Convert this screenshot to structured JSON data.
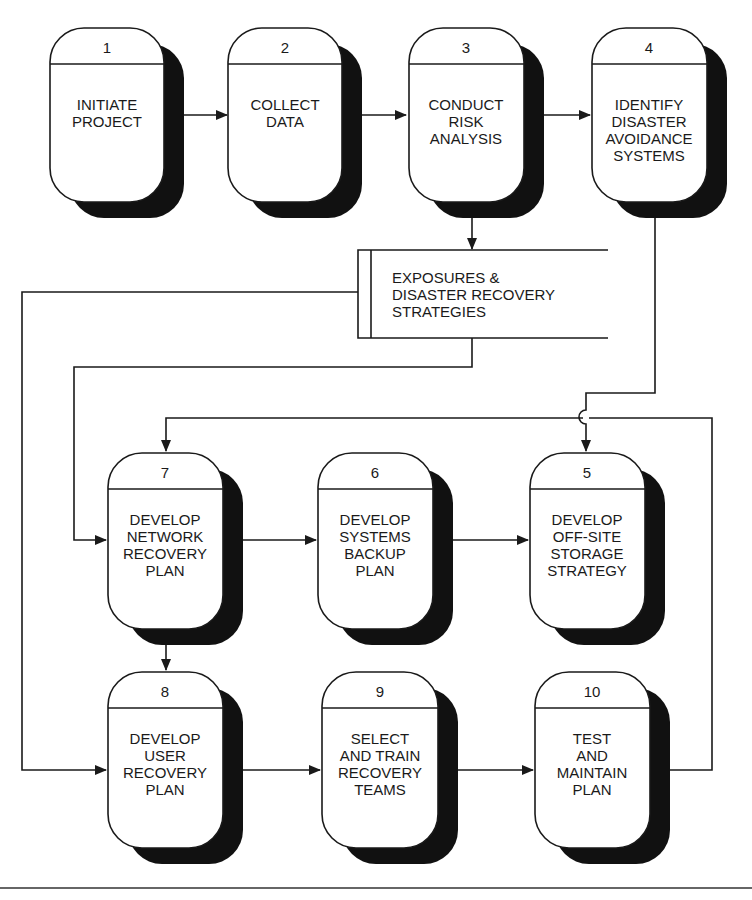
{
  "diagram": {
    "type": "process flowchart",
    "nodes": [
      {
        "id": "1",
        "number": "1",
        "lines": [
          "INITIATE",
          "PROJECT"
        ]
      },
      {
        "id": "2",
        "number": "2",
        "lines": [
          "COLLECT",
          "DATA"
        ]
      },
      {
        "id": "3",
        "number": "3",
        "lines": [
          "CONDUCT",
          "RISK",
          "ANALYSIS"
        ]
      },
      {
        "id": "4",
        "number": "4",
        "lines": [
          "IDENTIFY",
          "DISASTER",
          "AVOIDANCE",
          "SYSTEMS"
        ]
      },
      {
        "id": "7",
        "number": "7",
        "lines": [
          "DEVELOP",
          "NETWORK",
          "RECOVERY",
          "PLAN"
        ]
      },
      {
        "id": "6",
        "number": "6",
        "lines": [
          "DEVELOP",
          "SYSTEMS",
          "BACKUP",
          "PLAN"
        ]
      },
      {
        "id": "5",
        "number": "5",
        "lines": [
          "DEVELOP",
          "OFF-SITE",
          "STORAGE",
          "STRATEGY"
        ]
      },
      {
        "id": "8",
        "number": "8",
        "lines": [
          "DEVELOP",
          "USER",
          "RECOVERY",
          "PLAN"
        ]
      },
      {
        "id": "9",
        "number": "9",
        "lines": [
          "SELECT",
          "AND TRAIN",
          "RECOVERY",
          "TEAMS"
        ]
      },
      {
        "id": "10",
        "number": "10",
        "lines": [
          "TEST",
          "AND",
          "MAINTAIN",
          "PLAN"
        ]
      }
    ],
    "data_store": {
      "id": "store",
      "lines": [
        "EXPOSURES &",
        "DISASTER RECOVERY",
        "STRATEGIES"
      ]
    },
    "edges": [
      {
        "from": "1",
        "to": "2"
      },
      {
        "from": "2",
        "to": "3"
      },
      {
        "from": "3",
        "to": "4"
      },
      {
        "from": "3",
        "to": "store"
      },
      {
        "from": "store",
        "to": "7"
      },
      {
        "from": "store",
        "to": "8"
      },
      {
        "from": "4",
        "to": "5"
      },
      {
        "from": "7",
        "to": "6"
      },
      {
        "from": "6",
        "to": "5"
      },
      {
        "from": "7",
        "to": "8"
      },
      {
        "from": "8",
        "to": "9"
      },
      {
        "from": "9",
        "to": "10"
      },
      {
        "from": "10",
        "to": "7"
      }
    ]
  }
}
